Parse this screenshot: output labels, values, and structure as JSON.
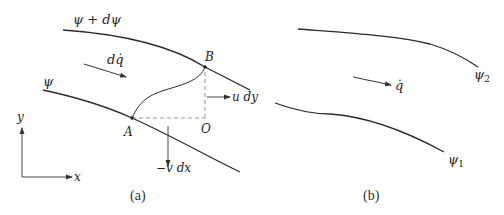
{
  "figure": {
    "panel_a": {
      "caption": "(a)",
      "streamline_upper": {
        "label": "ψ + dψ"
      },
      "streamline_lower": {
        "label": "ψ"
      },
      "flow_arrow": {
        "label": "dq̇"
      },
      "points": {
        "A": "A",
        "B": "B",
        "O": "O"
      },
      "velocity_components": {
        "horizontal": "u dy",
        "vertical": "−v dx"
      },
      "axes": {
        "x": "x",
        "y": "y"
      }
    },
    "panel_b": {
      "caption": "(b)",
      "streamline_upper": {
        "label": "ψ",
        "subscript": "2"
      },
      "streamline_lower": {
        "label": "ψ",
        "subscript": "1"
      },
      "flow_arrow": {
        "label": "q̇"
      }
    },
    "colors": {
      "line": "#2a2a2a",
      "dashed": "#888888",
      "background": "#ffffff"
    }
  }
}
